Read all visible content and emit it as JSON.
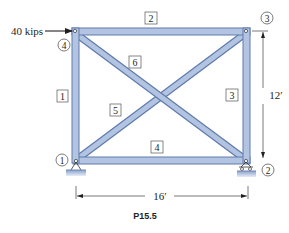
{
  "figure": {
    "caption": "P15.5",
    "load": {
      "label": "40 kips",
      "direction": "right",
      "applied_at_joint": "4"
    },
    "dimensions": {
      "height": "12′",
      "width": "16′"
    },
    "joints": [
      {
        "id": "1",
        "label": "1",
        "support": "pin"
      },
      {
        "id": "2",
        "label": "2",
        "support": "roller"
      },
      {
        "id": "3",
        "label": "3",
        "support": "none"
      },
      {
        "id": "4",
        "label": "4",
        "support": "none"
      }
    ],
    "members": [
      {
        "id": "1",
        "label": "1",
        "from": "1",
        "to": "4"
      },
      {
        "id": "2",
        "label": "2",
        "from": "4",
        "to": "3"
      },
      {
        "id": "3",
        "label": "3",
        "from": "3",
        "to": "2"
      },
      {
        "id": "4",
        "label": "4",
        "from": "1",
        "to": "2"
      },
      {
        "id": "5",
        "label": "5",
        "from": "1",
        "to": "3"
      },
      {
        "id": "6",
        "label": "6",
        "from": "4",
        "to": "2"
      }
    ],
    "colors": {
      "member_fill": "#b3c4e2",
      "member_edge": "#5f7cab",
      "support_fill": "#9fb4d8",
      "line": "#231f20"
    }
  }
}
